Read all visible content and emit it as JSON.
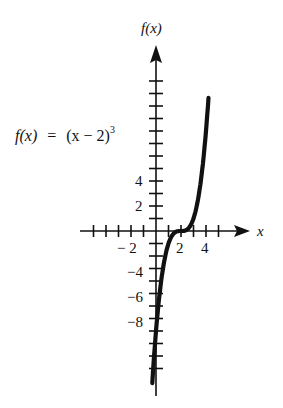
{
  "chart_data": {
    "type": "line",
    "title": "",
    "function": "f(x) = (x - 2)^3",
    "annotation": "f(x) = (x − 2)³",
    "xlabel": "x",
    "ylabel": "f(x)",
    "x_tick_labels": [
      "-2",
      "2",
      "4"
    ],
    "y_tick_labels": [
      "4",
      "2",
      "-2",
      "-4",
      "-6",
      "-8"
    ],
    "xlim": [
      -6,
      7
    ],
    "ylim": [
      -13,
      15
    ],
    "x_ticks": [
      -5,
      -4,
      -3,
      -2,
      -1,
      1,
      2,
      3,
      4,
      5
    ],
    "y_ticks": [
      -11,
      -10,
      -9,
      -8,
      -7,
      -6,
      -5,
      -4,
      -3,
      -2,
      -1,
      1,
      2,
      3,
      4,
      5,
      6,
      7,
      8,
      9,
      10,
      11,
      12
    ],
    "grid": false,
    "legend": null,
    "series": [
      {
        "name": "f(x) = (x - 2)^3",
        "x": [
          -0.3,
          0,
          0.5,
          1,
          1.5,
          2,
          2.5,
          3,
          3.5,
          4,
          4.2
        ],
        "y": [
          -12.17,
          -8,
          -3.375,
          -1,
          -0.125,
          0,
          0.125,
          1,
          3.375,
          8,
          10.65
        ]
      }
    ]
  },
  "labels": {
    "y_axis": "f(x)",
    "x_axis": "x",
    "equation_f": "f(x)",
    "equation_eq": "=",
    "equation_rhs": "(x − 2)",
    "equation_exp": "3",
    "x2": "2",
    "x4": "4",
    "xm2": "− 2",
    "y4": "4",
    "y2": "2",
    "ym2": "−2",
    "ym4": "−4",
    "ym6": "−6",
    "ym8": "−8"
  }
}
